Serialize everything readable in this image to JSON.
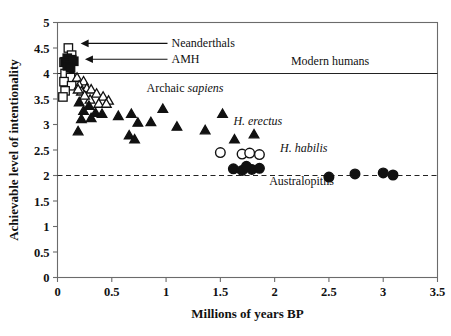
{
  "chart_data": {
    "type": "scatter",
    "title": "",
    "xlabel": "Millions of years BP",
    "ylabel": "Achievable level of intentionality",
    "xlim": [
      0,
      3.5
    ],
    "ylim": [
      0,
      5
    ],
    "xticks": [
      "0",
      "0.5",
      "1",
      "1.5",
      "2",
      "2.5",
      "3",
      "3.5"
    ],
    "yticks": [
      "0",
      "0.5",
      "1",
      "1.5",
      "2",
      "2.5",
      "3",
      "3.5",
      "4",
      "4.5",
      "5"
    ],
    "grid": false,
    "legend_position": "none",
    "reference_lines": [
      {
        "name": "modern-humans-line",
        "y": 4,
        "style": "solid",
        "label": "Modern humans"
      },
      {
        "name": "australopiths-line",
        "y": 2,
        "style": "dashed",
        "label": "Australopiths"
      }
    ],
    "annotations": [
      {
        "name": "neanderthals",
        "text": "Neanderthals",
        "italic": false,
        "x": 1.05,
        "y": 4.52,
        "arrow_to_x": 0.13
      },
      {
        "name": "amh",
        "text": "AMH",
        "italic": false,
        "x": 1.05,
        "y": 4.21,
        "arrow_to_x": 0.17
      },
      {
        "name": "modern-humans",
        "text": "Modern humans",
        "italic": false,
        "x": 2.15,
        "y": 4.17
      },
      {
        "name": "archaic-sapiens",
        "text": "Archaic ",
        "text_italic": "sapiens",
        "x": 0.82,
        "y": 3.63
      },
      {
        "name": "h-erectus",
        "text": "H. erectus",
        "italic": true,
        "x": 1.62,
        "y": 3.0
      },
      {
        "name": "h-habilis",
        "text": "H. habilis",
        "italic": true,
        "x": 2.05,
        "y": 2.46
      },
      {
        "name": "australopiths",
        "text": "Australopiths",
        "italic": false,
        "x": 1.95,
        "y": 1.82
      }
    ],
    "series": [
      {
        "name": "Neanderthals / archaic (open squares)",
        "marker": "open-square",
        "points": [
          [
            0.1,
            4.5
          ],
          [
            0.13,
            4.36
          ],
          [
            0.06,
            4.22
          ],
          [
            0.11,
            4.1
          ],
          [
            0.07,
            4.0
          ],
          [
            0.12,
            3.92
          ],
          [
            0.06,
            3.84
          ],
          [
            0.13,
            3.76
          ],
          [
            0.07,
            3.66
          ],
          [
            0.05,
            3.54
          ]
        ]
      },
      {
        "name": "AMH (filled squares)",
        "marker": "filled-square",
        "points": [
          [
            0.09,
            4.3
          ],
          [
            0.13,
            4.27
          ],
          [
            0.07,
            4.23
          ],
          [
            0.11,
            4.19
          ],
          [
            0.15,
            4.24
          ],
          [
            0.09,
            4.15
          ],
          [
            0.12,
            4.11
          ]
        ]
      },
      {
        "name": "Archaic sapiens (open triangles)",
        "marker": "open-triangle",
        "points": [
          [
            0.18,
            3.93
          ],
          [
            0.24,
            3.86
          ],
          [
            0.2,
            3.78
          ],
          [
            0.27,
            3.72
          ],
          [
            0.22,
            3.66
          ],
          [
            0.31,
            3.7
          ],
          [
            0.36,
            3.62
          ],
          [
            0.42,
            3.56
          ],
          [
            0.3,
            3.5
          ],
          [
            0.47,
            3.48
          ],
          [
            0.38,
            3.42
          ],
          [
            0.25,
            3.58
          ],
          [
            0.19,
            3.7
          ],
          [
            0.45,
            3.42
          ]
        ]
      },
      {
        "name": "H. erectus (filled triangles)",
        "marker": "filled-triangle",
        "points": [
          [
            0.2,
            3.45
          ],
          [
            0.29,
            3.38
          ],
          [
            0.24,
            3.28
          ],
          [
            0.35,
            3.24
          ],
          [
            0.41,
            3.22
          ],
          [
            0.22,
            3.12
          ],
          [
            0.31,
            3.14
          ],
          [
            0.19,
            2.88
          ],
          [
            0.56,
            3.18
          ],
          [
            0.68,
            3.22
          ],
          [
            0.74,
            3.05
          ],
          [
            0.66,
            2.8
          ],
          [
            0.71,
            2.72
          ],
          [
            0.86,
            3.06
          ],
          [
            0.97,
            3.32
          ],
          [
            1.1,
            2.97
          ],
          [
            1.36,
            2.9
          ],
          [
            1.52,
            3.22
          ],
          [
            1.63,
            2.72
          ],
          [
            1.81,
            2.82
          ]
        ]
      },
      {
        "name": "H. habilis (open circles)",
        "marker": "open-circle",
        "points": [
          [
            1.5,
            2.45
          ],
          [
            1.7,
            2.42
          ],
          [
            1.77,
            2.44
          ],
          [
            1.86,
            2.41
          ]
        ]
      },
      {
        "name": "Australopiths (filled circles)",
        "marker": "filled-circle",
        "points": [
          [
            1.62,
            2.13
          ],
          [
            1.7,
            2.1
          ],
          [
            1.79,
            2.12
          ],
          [
            1.86,
            2.14
          ],
          [
            1.74,
            2.18
          ],
          [
            2.5,
            1.97
          ],
          [
            2.74,
            2.03
          ],
          [
            3.0,
            2.05
          ],
          [
            3.09,
            2.01
          ]
        ]
      }
    ]
  }
}
